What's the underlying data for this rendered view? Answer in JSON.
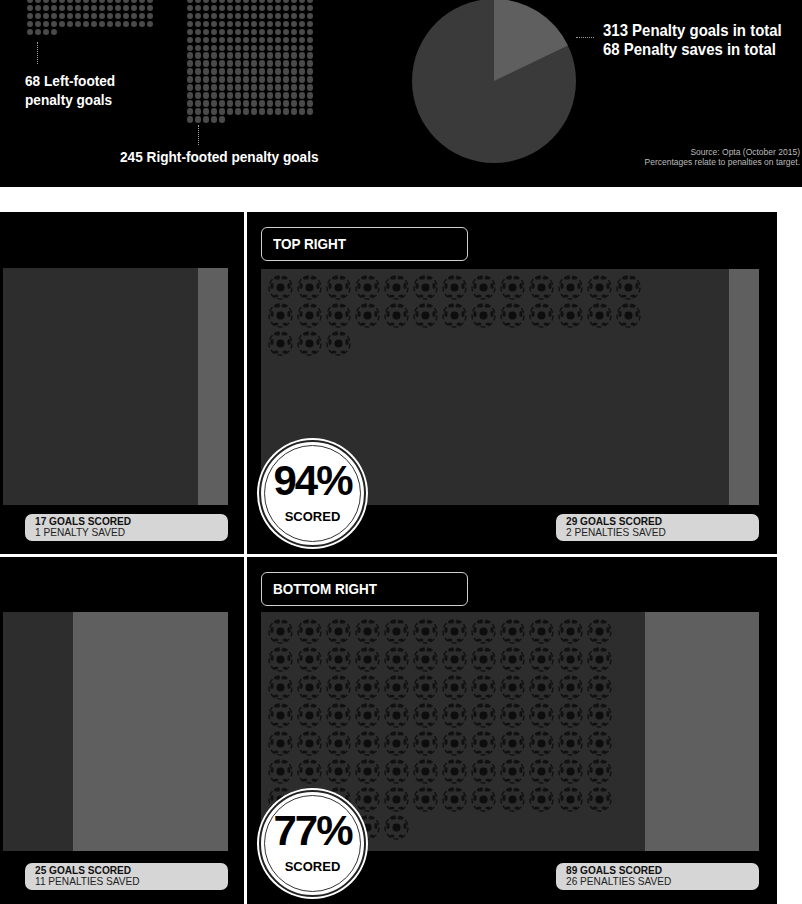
{
  "header": {
    "left_footed_label_line1": "68 Left-footed",
    "left_footed_label_line2": "penalty goals",
    "right_footed_label": "245 Right-footed penalty goals",
    "total_goals_label": "313 Penalty goals in total",
    "total_saves_label": "68 Penalty saves in total",
    "source_line1": "Source: Opta  (October 2015)",
    "source_line2": "Percentages relate to penalties on target."
  },
  "chart_data": [
    {
      "type": "pie",
      "title": "Penalty outcomes",
      "categories": [
        "Penalty goals",
        "Penalty saves"
      ],
      "values": [
        313,
        68
      ],
      "colors": [
        "#3a3a3a",
        "#5f5f5f"
      ]
    },
    {
      "type": "bar",
      "title": "Penalty goals by footedness (dot matrix)",
      "categories": [
        "Left-footed",
        "Right-footed"
      ],
      "values": [
        68,
        245
      ]
    }
  ],
  "panels": {
    "top_left": {
      "goals_line": "17 GOALS SCORED",
      "saves_line": "1 PENALTY SAVED",
      "goals": 17,
      "saves": 1
    },
    "top_right": {
      "title": "TOP RIGHT",
      "percent": "94%",
      "percent_label": "SCORED",
      "goals_line": "29 GOALS SCORED",
      "saves_line": "2 PENALTIES SAVED",
      "goals": 29,
      "saves": 2
    },
    "bottom_left": {
      "goals_line": "25 GOALS SCORED",
      "saves_line": "11 PENALTIES SAVED",
      "goals": 25,
      "saves": 11
    },
    "bottom_right": {
      "title": "BOTTOM RIGHT",
      "percent": "77%",
      "percent_label": "SCORED",
      "goals_line": "89 GOALS SCORED",
      "saves_line": "26 PENALTIES SAVED",
      "goals": 89,
      "saves": 26
    }
  },
  "colors": {
    "background": "#000000",
    "goal_dark": "#2d2d2d",
    "goal_light": "#5f5f5f",
    "stat_box": "#d6d6d6",
    "dot": "#4a4a4a"
  }
}
